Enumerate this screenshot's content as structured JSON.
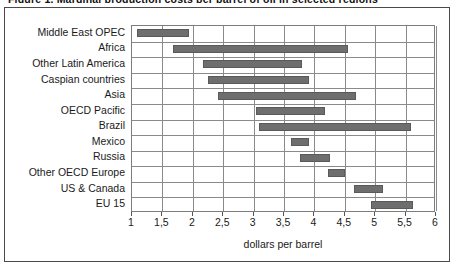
{
  "figure": {
    "caption_sliver": "Figure 1. Marginal production costs per barrel of oil in selected regions",
    "frame_color": "#4a4a4a",
    "bar_color": "#6e6e6e",
    "grid_color": "#8a8a8a"
  },
  "chart_data": {
    "type": "bar",
    "orientation": "horizontal",
    "style": "range-bars",
    "title": "",
    "subtitle": "",
    "xlabel": "dollars per barrel",
    "ylabel": "",
    "xlim": [
      1,
      6
    ],
    "grid": true,
    "legend": null,
    "decimal_separator": ",",
    "xticks": [
      1,
      1.5,
      2,
      2.5,
      3,
      3.5,
      4,
      4.5,
      5,
      5.5,
      6
    ],
    "xtick_labels": [
      "1",
      "1,5",
      "2",
      "2,5",
      "3",
      "3,5",
      "4",
      "4,5",
      "5",
      "5,5",
      "6"
    ],
    "categories": [
      "Middle East OPEC",
      "Africa",
      "Other Latin America",
      "Caspian countries",
      "Asia",
      "OECD Pacific",
      "Brazil",
      "Mexico",
      "Russia",
      "Other OECD Europe",
      "US & Canada",
      "EU 15"
    ],
    "ranges": [
      {
        "category": "Middle East OPEC",
        "low": 1.08,
        "high": 1.94
      },
      {
        "category": "Africa",
        "low": 1.67,
        "high": 4.55
      },
      {
        "category": "Other Latin America",
        "low": 2.17,
        "high": 3.8
      },
      {
        "category": "Caspian countries",
        "low": 2.25,
        "high": 3.91
      },
      {
        "category": "Asia",
        "low": 2.41,
        "high": 4.68
      },
      {
        "category": "OECD Pacific",
        "low": 3.04,
        "high": 4.17
      },
      {
        "category": "Brazil",
        "low": 3.09,
        "high": 5.59
      },
      {
        "category": "Mexico",
        "low": 3.62,
        "high": 3.91
      },
      {
        "category": "Russia",
        "low": 3.76,
        "high": 4.26
      },
      {
        "category": "Other OECD Europe",
        "low": 4.22,
        "high": 4.5
      },
      {
        "category": "US & Canada",
        "low": 4.65,
        "high": 5.13
      },
      {
        "category": "EU 15",
        "low": 4.93,
        "high": 5.62
      }
    ]
  }
}
